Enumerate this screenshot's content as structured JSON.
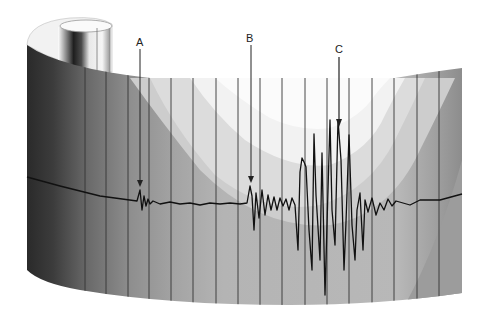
{
  "figure": {
    "labels": {
      "a": "A",
      "b": "B",
      "c": "C"
    },
    "colors": {
      "background": "#ffffff",
      "trace": "#111111",
      "time_lines": "#333333",
      "paper_light": "#f4f4f4",
      "paper_mid": "#cfcfcf",
      "paper_dark": "#a9a9a9",
      "drum_shadow": "#2a2a2a"
    }
  }
}
